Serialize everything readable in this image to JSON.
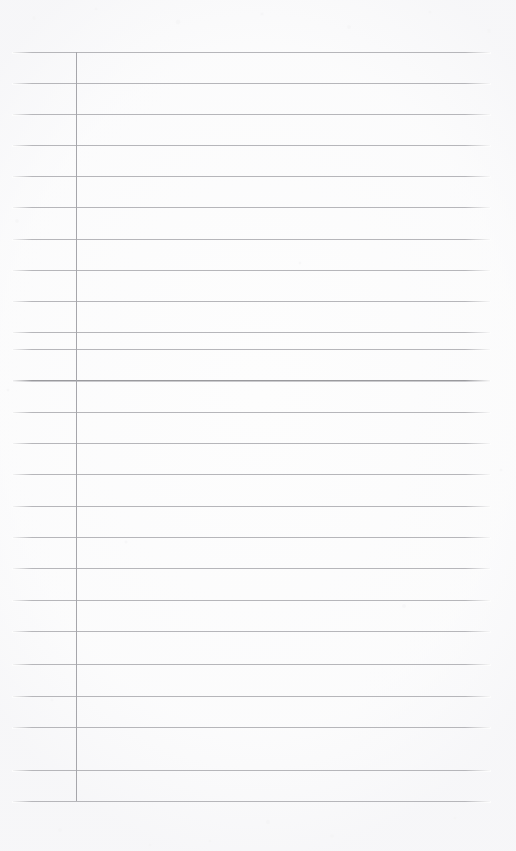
{
  "page": {
    "kind": "ruled-notepad-scan",
    "width": 516,
    "height": 851,
    "background_color": "#fdfdfd",
    "content_text": "",
    "is_blank": "true"
  },
  "rules": {
    "line_color": "#b6b6ba",
    "emphasis_line_color": "#9a9a9e",
    "margin_rule_color": "#a6a6ab",
    "line_count": 25,
    "line_spacing_px": 31.2,
    "first_line_y": 52,
    "last_line_y": 801,
    "line_start_x": 13,
    "line_end_x": 490,
    "margin_rule_x": 76,
    "emphasis_line_index": 11,
    "lines": [
      {
        "y": 52,
        "emphasis": false
      },
      {
        "y": 83,
        "emphasis": false
      },
      {
        "y": 114,
        "emphasis": false
      },
      {
        "y": 145,
        "emphasis": false
      },
      {
        "y": 176,
        "emphasis": false
      },
      {
        "y": 207,
        "emphasis": false
      },
      {
        "y": 239,
        "emphasis": false
      },
      {
        "y": 270,
        "emphasis": false
      },
      {
        "y": 301,
        "emphasis": false
      },
      {
        "y": 332,
        "emphasis": false
      },
      {
        "y": 349,
        "emphasis": false
      },
      {
        "y": 380,
        "emphasis": true
      },
      {
        "y": 412,
        "emphasis": false
      },
      {
        "y": 443,
        "emphasis": false
      },
      {
        "y": 474,
        "emphasis": false
      },
      {
        "y": 506,
        "emphasis": false
      },
      {
        "y": 537,
        "emphasis": false
      },
      {
        "y": 568,
        "emphasis": false
      },
      {
        "y": 600,
        "emphasis": false
      },
      {
        "y": 631,
        "emphasis": false
      },
      {
        "y": 664,
        "emphasis": false
      },
      {
        "y": 696,
        "emphasis": false
      },
      {
        "y": 727,
        "emphasis": false
      },
      {
        "y": 770,
        "emphasis": false
      },
      {
        "y": 801,
        "emphasis": false
      }
    ]
  },
  "margins": {
    "top_margin_px": 52,
    "bottom_margin_px": 50,
    "left_margin_px": 13,
    "right_gutter_px": 26
  }
}
